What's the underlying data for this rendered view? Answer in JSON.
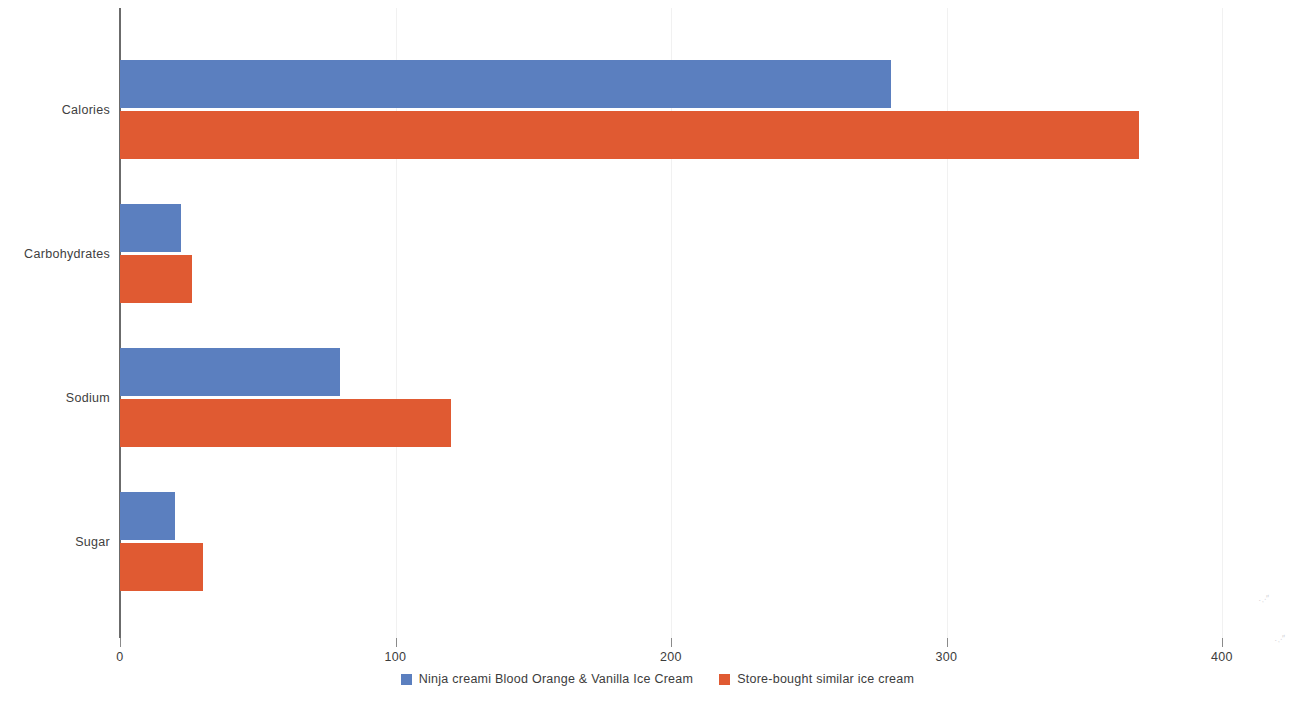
{
  "chart_data": {
    "type": "bar",
    "orientation": "horizontal",
    "title": "",
    "xlabel": "",
    "ylabel": "",
    "categories": [
      "Calories",
      "Carbohydrates",
      "Sodium",
      "Sugar"
    ],
    "series": [
      {
        "name": "Ninja creami Blood Orange & Vanilla Ice Cream",
        "color": "#5b7fbf",
        "values": [
          280,
          22,
          80,
          20
        ]
      },
      {
        "name": "Store-bought similar ice cream",
        "color": "#e05a32",
        "values": [
          370,
          26,
          120,
          30
        ]
      }
    ],
    "xlim": [
      0,
      400
    ],
    "xticks": [
      0,
      100,
      200,
      300,
      400
    ],
    "xtick_labels": [
      "0",
      "100",
      "200",
      "300",
      "400"
    ],
    "grid": true,
    "grid_axis": "x",
    "legend_position": "bottom"
  },
  "axis": {
    "ticks": [
      {
        "label": "0",
        "value": 0
      },
      {
        "label": "100",
        "value": 100
      },
      {
        "label": "200",
        "value": 200
      },
      {
        "label": "300",
        "value": 300
      },
      {
        "label": "400",
        "value": 400
      }
    ]
  },
  "legend": {
    "items": [
      {
        "label": "Ninja creami Blood Orange & Vanilla Ice Cream",
        "color": "#5b7fbf"
      },
      {
        "label": "Store-bought similar ice cream",
        "color": "#e05a32"
      }
    ]
  }
}
